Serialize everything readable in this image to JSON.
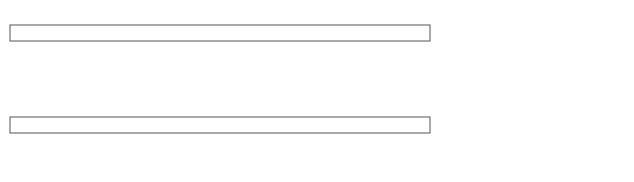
{
  "diagram": {
    "type": "transfer-press feed mechanism (top view)",
    "dies": [
      {
        "label": "Die\nNo. 8",
        "line1": "Die",
        "line2": "No. 8"
      },
      {
        "label": "Die\nNo. 7",
        "line1": "Die",
        "line2": "No. 7"
      },
      {
        "label": "Die\nNo. 6",
        "line1": "Die",
        "line2": "No. 6"
      },
      {
        "label": "Die\nNo. 5",
        "line1": "Die",
        "line2": "No. 5"
      },
      {
        "label": "Die\nNo. 4",
        "line1": "Die",
        "line2": "No. 4"
      },
      {
        "label": "Die\nNo. 3",
        "line1": "Die",
        "line2": "No. 3"
      },
      {
        "label": "Die\nNo. 2",
        "line1": "Die",
        "line2": "No. 2"
      },
      {
        "label": "Die\nNo. 1",
        "line1": "Die",
        "line2": "No.1"
      }
    ],
    "labels": {
      "feed_motor_1": "Feed",
      "feed_motor_2": "motor",
      "feed_stops": "Feed stops",
      "clamp_motor_1_a": "Clamp",
      "clamp_motor_1_b": "motor No. 1",
      "feed_fingers_a": "Feed",
      "feed_fingers_b": "fingers",
      "return_stops_a": "Return",
      "return_stops_b": "stops",
      "clamp_motor_2_a": "Clamp",
      "clamp_motor_2_b": "motor No. 2",
      "clamp_stops_a": "Clamp",
      "clamp_stops_b": "stops",
      "unclamp_stops_a": "Unclamp",
      "unclamp_stops_b": "stops"
    },
    "colors": {
      "line": "#555555",
      "fill": "#ffffff",
      "shaded": "#bdbdbd"
    }
  }
}
